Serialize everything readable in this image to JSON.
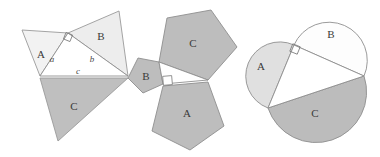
{
  "figure": {
    "background_color": "#ffffff",
    "panels": [
      {
        "id": "triangles",
        "name": "similar-triangles-panel",
        "shape_type": "triangle",
        "labels": {
          "a": "A",
          "b": "B",
          "c": "C"
        },
        "side_labels": {
          "a": "a",
          "b": "b",
          "c": "c"
        },
        "right_angle": true,
        "base_triangle": {
          "vertex_right_angle": [
            68,
            33
          ],
          "vertex_left": [
            40,
            76
          ],
          "vertex_right": [
            128,
            76
          ]
        },
        "shapes": [
          {
            "label": "A",
            "fill": "#f2f2f2",
            "stroke": "#9a9a9a",
            "points": "40,76 68,33 22,30",
            "label_pos": [
              41,
              58
            ]
          },
          {
            "label": "B",
            "fill": "#ededed",
            "stroke": "#9a9a9a",
            "points": "68,33 128,76 119,11",
            "label_pos": [
              101,
              40
            ]
          },
          {
            "label": "C",
            "fill": "#bfbfbf",
            "stroke": "#9a9a9a",
            "points": "40,78 128,78 58,141",
            "label_pos": [
              74,
              110
            ]
          }
        ]
      },
      {
        "id": "pentagons",
        "name": "regular-pentagons-panel",
        "shape_type": "pentagon",
        "labels": {
          "a": "A",
          "b": "B",
          "c": "C"
        },
        "right_angle": true,
        "base_triangle": {
          "vertex_right_angle": [
            163,
            84
          ],
          "vertex_left": [
            159,
            62
          ],
          "vertex_right": [
            208,
            80
          ]
        },
        "shapes": [
          {
            "label": "A",
            "fill": "#bdbdbd",
            "stroke": "#8f8f8f",
            "points": "163,86 208,82 224,126 190,150 152,131",
            "label_pos": [
              187,
              115
            ]
          },
          {
            "label": "B",
            "fill": "#bdbdbd",
            "stroke": "#8f8f8f",
            "points": "159,62 163,84 143,93 128,78 138,58",
            "label_pos": [
              146,
              79
            ]
          },
          {
            "label": "C",
            "fill": "#bdbdbd",
            "stroke": "#8f8f8f",
            "points": "159,62 208,80 237,47 211,10 167,18",
            "label_pos": [
              193,
              46
            ]
          }
        ]
      },
      {
        "id": "semicircles",
        "name": "semicircles-panel",
        "shape_type": "semicircle",
        "labels": {
          "a": "A",
          "b": "B",
          "c": "C"
        },
        "right_angle": true,
        "base_triangle": {
          "vertex_right_angle": [
            294,
            45
          ],
          "vertex_left": [
            268,
            108
          ],
          "vertex_right": [
            364,
            76
          ]
        },
        "shapes": [
          {
            "label": "A",
            "fill": "#e0e0e0",
            "stroke": "#8f8f8f",
            "label_pos": [
              261,
              68
            ]
          },
          {
            "label": "B",
            "fill": "#fdfdfd",
            "stroke": "#8f8f8f",
            "label_pos": [
              331,
              36
            ]
          },
          {
            "label": "C",
            "fill": "#bcbcbc",
            "stroke": "#8f8f8f",
            "label_pos": [
              315,
              114
            ]
          }
        ]
      }
    ]
  }
}
